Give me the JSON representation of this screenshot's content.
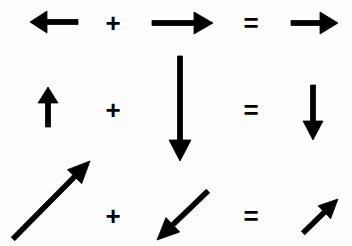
{
  "figure": {
    "name": "vector-addition-diagram",
    "background_color": "#fdfdfd",
    "ink_color": "#000000",
    "width": 352,
    "height": 246
  },
  "operators": {
    "plus": "+",
    "equals": "="
  },
  "equations": [
    {
      "id": "row-1",
      "label": "left arrow plus right arrow equals right arrow",
      "operand_a": {
        "name": "arrow-left-short",
        "direction": "left",
        "x1": 78,
        "y1": 22,
        "x2": 30,
        "y2": 22,
        "shaft_width": 5,
        "head_length": 17,
        "head_half_width": 11
      },
      "operator_1": {
        "name": "plus-operator",
        "symbol": "+",
        "x": 113,
        "y": 23,
        "size": 26
      },
      "operand_b": {
        "name": "arrow-right-long",
        "direction": "right",
        "x1": 152,
        "y1": 23,
        "x2": 213,
        "y2": 23,
        "shaft_width": 5,
        "head_length": 19,
        "head_half_width": 11
      },
      "operator_2": {
        "name": "equals-operator",
        "symbol": "=",
        "x": 251,
        "y": 23,
        "size": 26
      },
      "result": {
        "name": "arrow-right-short",
        "direction": "right",
        "x1": 291,
        "y1": 23,
        "x2": 338,
        "y2": 23,
        "shaft_width": 5,
        "head_length": 18,
        "head_half_width": 11
      }
    },
    {
      "id": "row-2",
      "label": "up arrow plus long down arrow equals down arrow",
      "operand_a": {
        "name": "arrow-up-short",
        "direction": "up",
        "x1": 48,
        "y1": 127,
        "x2": 48,
        "y2": 87,
        "shaft_width": 5,
        "head_length": 16,
        "head_half_width": 10
      },
      "operator_1": {
        "name": "plus-operator",
        "symbol": "+",
        "x": 113,
        "y": 110,
        "size": 26
      },
      "operand_b": {
        "name": "arrow-down-long",
        "direction": "down",
        "x1": 180,
        "y1": 56,
        "x2": 180,
        "y2": 161,
        "shaft_width": 5,
        "head_length": 21,
        "head_half_width": 11
      },
      "operator_2": {
        "name": "equals-operator",
        "symbol": "=",
        "x": 251,
        "y": 110,
        "size": 26
      },
      "result": {
        "name": "arrow-down-medium",
        "direction": "down",
        "x1": 313,
        "y1": 85,
        "x2": 313,
        "y2": 140,
        "shaft_width": 5,
        "head_length": 19,
        "head_half_width": 10
      }
    },
    {
      "id": "row-3",
      "label": "long up-right diagonal arrow plus down-left diagonal arrow equals short up-right diagonal arrow",
      "operand_a": {
        "name": "arrow-diagonal-up-right-long",
        "direction": "up-right",
        "x1": 13,
        "y1": 239,
        "x2": 90,
        "y2": 161,
        "shaft_width": 5,
        "head_length": 22,
        "head_half_width": 10
      },
      "operator_1": {
        "name": "plus-operator",
        "symbol": "+",
        "x": 113,
        "y": 216,
        "size": 26
      },
      "operand_b": {
        "name": "arrow-diagonal-down-left",
        "direction": "down-left",
        "x1": 208,
        "y1": 191,
        "x2": 157,
        "y2": 240,
        "shaft_width": 5,
        "head_length": 22,
        "head_half_width": 10
      },
      "operator_2": {
        "name": "equals-operator",
        "symbol": "=",
        "x": 251,
        "y": 216,
        "size": 26
      },
      "result": {
        "name": "arrow-diagonal-up-right-short",
        "direction": "up-right",
        "x1": 303,
        "y1": 233,
        "x2": 338,
        "y2": 199,
        "shaft_width": 5,
        "head_length": 19,
        "head_half_width": 9
      }
    }
  ]
}
